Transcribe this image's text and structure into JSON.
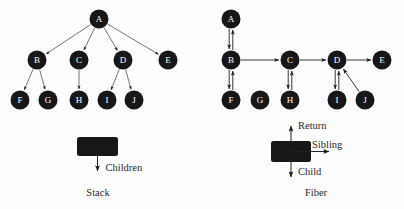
{
  "figure": {
    "background_color": "#fdfdfd",
    "node_fill": "#17171a",
    "node_text_color": "#ffffff",
    "edge_color": "#3a3a3a"
  },
  "left_diagram": {
    "caption": "Stack",
    "nodes": [
      {
        "id": "A",
        "label": "A",
        "cx": 99,
        "cy": 19,
        "r": 9.5
      },
      {
        "id": "B",
        "label": "B",
        "cx": 37,
        "cy": 60,
        "r": 9.5
      },
      {
        "id": "C",
        "label": "C",
        "cx": 79,
        "cy": 60,
        "r": 9.5
      },
      {
        "id": "D",
        "label": "D",
        "cx": 123,
        "cy": 60,
        "r": 9.5
      },
      {
        "id": "E",
        "label": "E",
        "cx": 168,
        "cy": 60,
        "r": 9.5
      },
      {
        "id": "F",
        "label": "F",
        "cx": 20,
        "cy": 100,
        "r": 9.5
      },
      {
        "id": "G",
        "label": "G",
        "cx": 48,
        "cy": 100,
        "r": 9.5
      },
      {
        "id": "H",
        "label": "H",
        "cx": 79,
        "cy": 100,
        "r": 9.5
      },
      {
        "id": "I",
        "label": "I",
        "cx": 107,
        "cy": 100,
        "r": 9.5
      },
      {
        "id": "J",
        "label": "J",
        "cx": 134,
        "cy": 100,
        "r": 9.5
      }
    ],
    "edges": [
      {
        "from": "A",
        "to": "B"
      },
      {
        "from": "A",
        "to": "C"
      },
      {
        "from": "A",
        "to": "D"
      },
      {
        "from": "A",
        "to": "E"
      },
      {
        "from": "B",
        "to": "F"
      },
      {
        "from": "B",
        "to": "G"
      },
      {
        "from": "C",
        "to": "H"
      },
      {
        "from": "D",
        "to": "I"
      },
      {
        "from": "D",
        "to": "J"
      }
    ],
    "legend": {
      "box": {
        "x": 77,
        "y": 137,
        "width": 41,
        "height": 19
      },
      "arrows": [
        {
          "name": "children",
          "label": "Children",
          "direction": "down"
        }
      ]
    }
  },
  "right_diagram": {
    "caption": "Fiber",
    "nodes": [
      {
        "id": "A",
        "label": "A",
        "cx": 231,
        "cy": 19,
        "r": 9.5
      },
      {
        "id": "B",
        "label": "B",
        "cx": 231,
        "cy": 60,
        "r": 9.5
      },
      {
        "id": "C",
        "label": "C",
        "cx": 290,
        "cy": 60,
        "r": 9.5
      },
      {
        "id": "D",
        "label": "D",
        "cx": 337,
        "cy": 60,
        "r": 9.5
      },
      {
        "id": "E",
        "label": "E",
        "cx": 382,
        "cy": 60,
        "r": 9.5
      },
      {
        "id": "F",
        "label": "F",
        "cx": 231,
        "cy": 100,
        "r": 9.5
      },
      {
        "id": "G",
        "label": "G",
        "cx": 260,
        "cy": 100,
        "r": 9.5
      },
      {
        "id": "H",
        "label": "H",
        "cx": 290,
        "cy": 100,
        "r": 9.5
      },
      {
        "id": "I",
        "label": "I",
        "cx": 337,
        "cy": 100,
        "r": 9.5
      },
      {
        "id": "J",
        "label": "J",
        "cx": 365,
        "cy": 100,
        "r": 9.5
      }
    ],
    "edges": [
      {
        "from": "A",
        "to": "B",
        "kind": "child"
      },
      {
        "from": "B",
        "to": "A",
        "kind": "return"
      },
      {
        "from": "B",
        "to": "C",
        "kind": "sibling"
      },
      {
        "from": "C",
        "to": "D",
        "kind": "sibling"
      },
      {
        "from": "D",
        "to": "E",
        "kind": "sibling"
      },
      {
        "from": "B",
        "to": "F",
        "kind": "child"
      },
      {
        "from": "F",
        "to": "B",
        "kind": "return"
      },
      {
        "from": "C",
        "to": "H",
        "kind": "child"
      },
      {
        "from": "H",
        "to": "C",
        "kind": "return"
      },
      {
        "from": "D",
        "to": "I",
        "kind": "child"
      },
      {
        "from": "I",
        "to": "D",
        "kind": "return"
      },
      {
        "from": "J",
        "to": "D",
        "kind": "return"
      }
    ],
    "legend": {
      "box": {
        "x": 271,
        "y": 141,
        "width": 40,
        "height": 21
      },
      "arrows": [
        {
          "name": "return",
          "label": "Return",
          "direction": "up"
        },
        {
          "name": "sibling",
          "label": "Sibling",
          "direction": "right"
        },
        {
          "name": "child",
          "label": "Child",
          "direction": "down"
        }
      ]
    }
  }
}
